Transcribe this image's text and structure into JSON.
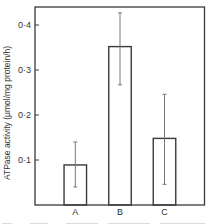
{
  "chart_data": {
    "type": "bar",
    "title": "",
    "xlabel": "",
    "ylabel": "ATPase activity (μmol/mg protein/h)",
    "categories": [
      "A",
      "B",
      "C"
    ],
    "values": [
      0.089,
      0.352,
      0.148
    ],
    "error_bars": [
      {
        "low": 0.04,
        "high": 0.14
      },
      {
        "low": 0.267,
        "high": 0.427
      },
      {
        "low": 0.046,
        "high": 0.246
      }
    ],
    "ylim": [
      0,
      0.44
    ],
    "yticks": [
      0.1,
      0.2,
      0.3,
      0.4
    ],
    "ytick_labels": [
      "0·1",
      "0·2",
      "0·3",
      "0·4"
    ],
    "grid": false,
    "legend": null,
    "bar_style": "outline",
    "colors": {
      "stroke": "#3a3a3a",
      "error": "#777777",
      "background": "#ffffff"
    }
  }
}
